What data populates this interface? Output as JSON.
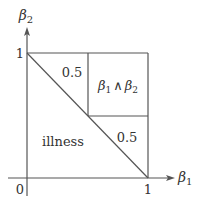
{
  "diagram": {
    "axes": {
      "x_label": "β",
      "x_label_sub": "1",
      "y_label": "β",
      "y_label_sub": "2",
      "origin_label": "0",
      "x_tick_label": "1",
      "y_tick_label": "1"
    },
    "regions": {
      "upper_left_triangle": "0.5",
      "top_right_square": "β₁ ∧ β₂",
      "top_right_square_parts": {
        "a": "β",
        "a_sub": "1",
        "op": "∧",
        "b": "β",
        "b_sub": "2"
      },
      "lower_right_triangle": "0.5",
      "lower_left_triangle": "illness"
    },
    "colors": {
      "line": "#555555",
      "text": "#333333"
    }
  }
}
